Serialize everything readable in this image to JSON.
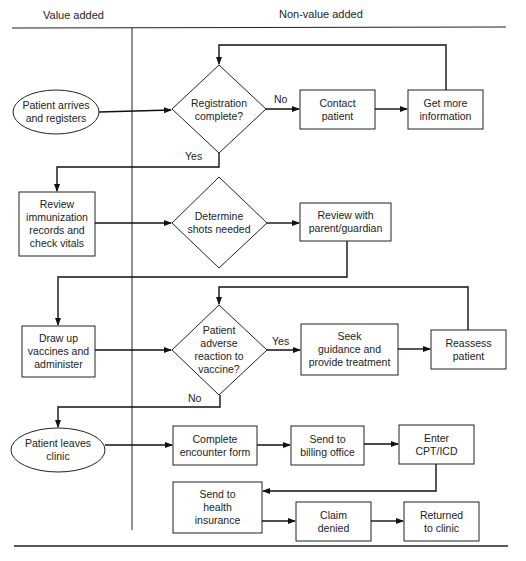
{
  "headers": {
    "left": "Value added",
    "right": "Non-value added"
  },
  "nodes": {
    "patient_arrives": [
      "Patient arrives",
      "and registers"
    ],
    "registration_complete": [
      "Registration",
      "complete?"
    ],
    "contact_patient": [
      "Contact",
      "patient"
    ],
    "get_more_info": [
      "Get more",
      "information"
    ],
    "review_immunization": [
      "Review",
      "immunization",
      "records and",
      "check vitals"
    ],
    "determine_shots": [
      "Determine",
      "shots needed"
    ],
    "review_parent": [
      "Review with",
      "parent/guardian"
    ],
    "draw_vaccines": [
      "Draw up",
      "vaccines and",
      "administer"
    ],
    "adverse_reaction": [
      "Patient",
      "adverse",
      "reaction to",
      "vaccine?"
    ],
    "seek_guidance": [
      "Seek",
      "guidance and",
      "provide treatment"
    ],
    "reassess": [
      "Reassess",
      "patient"
    ],
    "patient_leaves": [
      "Patient leaves",
      "clinic"
    ],
    "encounter_form": [
      "Complete",
      "encounter form"
    ],
    "billing_office": [
      "Send to",
      "billing office"
    ],
    "enter_cpt": [
      "Enter",
      "CPT/ICD"
    ],
    "health_insurance": [
      "Send to",
      "health",
      "insurance"
    ],
    "claim_denied": [
      "Claim",
      "denied"
    ],
    "returned_clinic": [
      "Returned",
      "to clinic"
    ]
  },
  "edge_labels": {
    "reg_no": "No",
    "reg_yes": "Yes",
    "adv_yes": "Yes",
    "adv_no": "No"
  }
}
